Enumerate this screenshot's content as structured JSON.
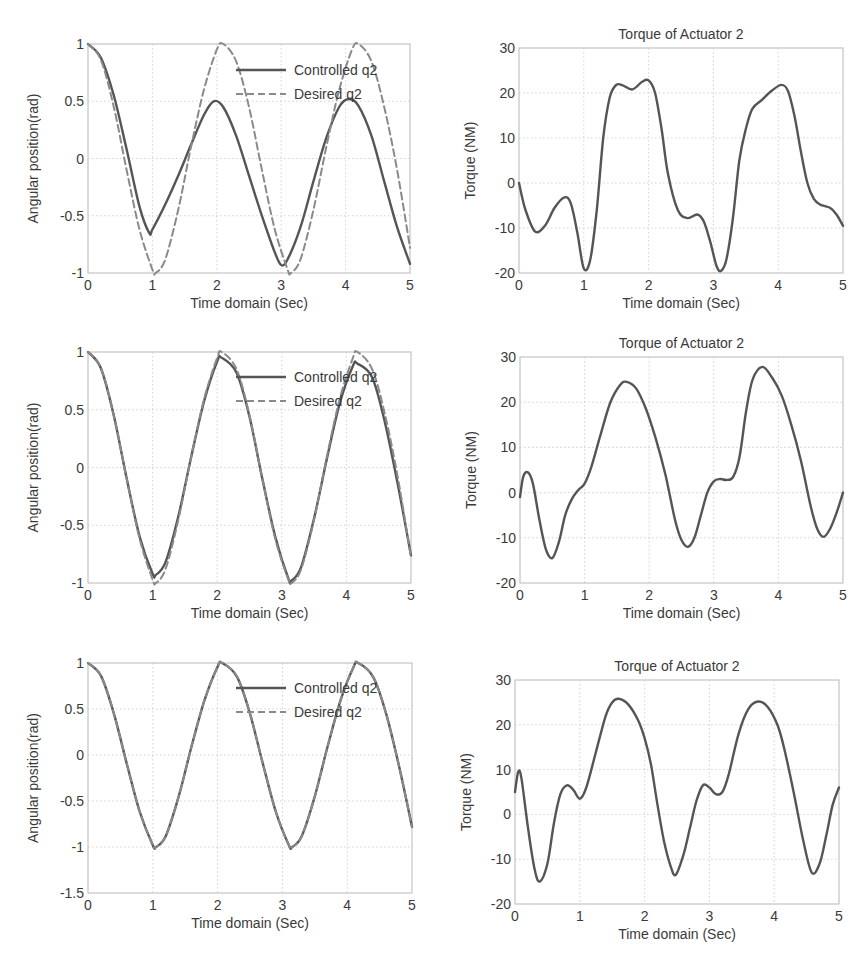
{
  "chart_data": [
    {
      "id": "p1",
      "type": "line",
      "title": "",
      "xlabel": "Time domain (Sec)",
      "ylabel": "Angular position(rad)",
      "xlim": [
        0,
        5
      ],
      "ylim": [
        -1,
        1
      ],
      "xticks": [
        0,
        1,
        2,
        3,
        4,
        5
      ],
      "yticks": [
        -1,
        -0.5,
        0,
        0.5,
        1
      ],
      "grid": true,
      "legend": {
        "position": "upper-right-inside",
        "entries": [
          "Controlled q2",
          "Desired q2"
        ]
      },
      "series": [
        {
          "name": "Controlled q2",
          "style": "solid",
          "x": [
            0,
            0.2,
            0.4,
            0.6,
            0.8,
            0.95,
            1.0,
            1.2,
            1.4,
            1.6,
            1.8,
            1.95,
            2.1,
            2.3,
            2.5,
            2.7,
            2.9,
            3.0,
            3.1,
            3.3,
            3.5,
            3.7,
            3.9,
            4.05,
            4.2,
            4.4,
            4.6,
            4.8,
            5.0
          ],
          "y": [
            1,
            0.88,
            0.55,
            0.08,
            -0.42,
            -0.65,
            -0.62,
            -0.4,
            -0.15,
            0.12,
            0.38,
            0.5,
            0.45,
            0.2,
            -0.15,
            -0.5,
            -0.82,
            -0.93,
            -0.88,
            -0.6,
            -0.2,
            0.18,
            0.45,
            0.52,
            0.46,
            0.2,
            -0.2,
            -0.6,
            -0.92
          ]
        },
        {
          "name": "Desired q2",
          "style": "dashed",
          "x": [
            0,
            0.2,
            0.4,
            0.6,
            0.8,
            1.0,
            1.05,
            1.2,
            1.4,
            1.6,
            1.8,
            2.0,
            2.1,
            2.3,
            2.5,
            2.7,
            2.9,
            3.1,
            3.15,
            3.3,
            3.5,
            3.7,
            3.9,
            4.1,
            4.2,
            4.4,
            4.6,
            4.8,
            5.0
          ],
          "y": [
            1,
            0.86,
            0.45,
            -0.1,
            -0.62,
            -0.97,
            -1.0,
            -0.88,
            -0.45,
            0.1,
            0.6,
            0.95,
            1.0,
            0.85,
            0.45,
            -0.1,
            -0.62,
            -0.97,
            -1.0,
            -0.88,
            -0.45,
            0.1,
            0.6,
            0.95,
            1.0,
            0.85,
            0.45,
            -0.1,
            -0.78
          ]
        }
      ]
    },
    {
      "id": "p2",
      "type": "line",
      "title": "Torque of Actuator 2",
      "xlabel": "Time domain (Sec)",
      "ylabel": "Torque (NM)",
      "xlim": [
        0,
        5
      ],
      "ylim": [
        -20,
        30
      ],
      "xticks": [
        0,
        1,
        2,
        3,
        4,
        5
      ],
      "yticks": [
        -20,
        -10,
        0,
        10,
        20,
        30
      ],
      "grid": true,
      "series": [
        {
          "name": "Torque",
          "x": [
            0,
            0.1,
            0.25,
            0.4,
            0.55,
            0.7,
            0.8,
            0.9,
            1.0,
            1.1,
            1.2,
            1.3,
            1.4,
            1.5,
            1.6,
            1.75,
            1.9,
            2.0,
            2.1,
            2.2,
            2.3,
            2.45,
            2.6,
            2.75,
            2.85,
            2.95,
            3.05,
            3.12,
            3.2,
            3.3,
            3.4,
            3.5,
            3.6,
            3.75,
            3.9,
            4.05,
            4.15,
            4.25,
            4.35,
            4.45,
            4.55,
            4.65,
            4.8,
            4.9,
            5.0
          ],
          "y": [
            0,
            -6,
            -10.8,
            -9.5,
            -5.5,
            -3.2,
            -4.5,
            -11,
            -19,
            -17,
            -6,
            10,
            19,
            21.8,
            21.7,
            20.8,
            22.5,
            22.8,
            20,
            12,
            2,
            -6,
            -7.8,
            -7,
            -8.5,
            -13,
            -18.5,
            -19.5,
            -17,
            -8,
            5,
            12,
            16.5,
            18.5,
            20.5,
            21.8,
            20.5,
            15,
            7,
            0,
            -3.5,
            -4.8,
            -5.5,
            -7,
            -9.5
          ]
        }
      ]
    },
    {
      "id": "p3",
      "type": "line",
      "title": "",
      "xlabel": "Time domain (Sec)",
      "ylabel": "Angular position(rad)",
      "xlim": [
        0,
        5
      ],
      "ylim": [
        -1,
        1
      ],
      "xticks": [
        0,
        1,
        2,
        3,
        4,
        5
      ],
      "yticks": [
        -1,
        -0.5,
        0,
        0.5,
        1
      ],
      "grid": true,
      "legend": {
        "position": "upper-right-inside",
        "entries": [
          "Controlled q2",
          "Desired q2"
        ]
      },
      "series": [
        {
          "name": "Controlled q2",
          "style": "solid",
          "x": [
            0,
            0.2,
            0.4,
            0.6,
            0.8,
            1.0,
            1.05,
            1.2,
            1.4,
            1.6,
            1.8,
            2.0,
            2.07,
            2.3,
            2.5,
            2.7,
            2.9,
            3.1,
            3.15,
            3.3,
            3.5,
            3.7,
            3.9,
            4.1,
            4.17,
            4.4,
            4.6,
            4.8,
            5.0
          ],
          "y": [
            1,
            0.86,
            0.45,
            -0.1,
            -0.6,
            -0.92,
            -0.93,
            -0.82,
            -0.42,
            0.1,
            0.58,
            0.92,
            0.95,
            0.82,
            0.44,
            -0.1,
            -0.6,
            -0.96,
            -0.98,
            -0.86,
            -0.44,
            0.08,
            0.56,
            0.88,
            0.9,
            0.78,
            0.38,
            -0.16,
            -0.76
          ]
        },
        {
          "name": "Desired q2",
          "style": "dashed",
          "x": [
            0,
            0.2,
            0.4,
            0.6,
            0.8,
            1.0,
            1.05,
            1.2,
            1.4,
            1.6,
            1.8,
            2.0,
            2.07,
            2.3,
            2.5,
            2.7,
            2.9,
            3.1,
            3.15,
            3.3,
            3.5,
            3.7,
            3.9,
            4.1,
            4.17,
            4.4,
            4.6,
            4.8,
            5.0
          ],
          "y": [
            1,
            0.86,
            0.45,
            -0.1,
            -0.62,
            -0.97,
            -1.0,
            -0.88,
            -0.45,
            0.1,
            0.6,
            0.95,
            1.0,
            0.85,
            0.45,
            -0.1,
            -0.62,
            -0.97,
            -1.0,
            -0.88,
            -0.45,
            0.1,
            0.6,
            0.95,
            1.0,
            0.85,
            0.45,
            -0.1,
            -0.78
          ]
        }
      ]
    },
    {
      "id": "p4",
      "type": "line",
      "title": "Torque of Actuator 2",
      "xlabel": "Time domain (Sec)",
      "ylabel": "Torque (NM)",
      "xlim": [
        0,
        5
      ],
      "ylim": [
        -20,
        30
      ],
      "xticks": [
        0,
        1,
        2,
        3,
        4,
        5
      ],
      "yticks": [
        -20,
        -10,
        0,
        10,
        20,
        30
      ],
      "grid": true,
      "series": [
        {
          "name": "Torque",
          "x": [
            0,
            0.05,
            0.12,
            0.2,
            0.3,
            0.4,
            0.5,
            0.6,
            0.7,
            0.8,
            0.9,
            1.0,
            1.1,
            1.25,
            1.4,
            1.55,
            1.65,
            1.8,
            1.95,
            2.1,
            2.25,
            2.4,
            2.5,
            2.6,
            2.7,
            2.8,
            2.9,
            3.0,
            3.1,
            3.2,
            3.3,
            3.4,
            3.5,
            3.6,
            3.75,
            3.9,
            4.05,
            4.2,
            4.35,
            4.5,
            4.6,
            4.7,
            4.8,
            4.9,
            5.0
          ],
          "y": [
            -1,
            3.5,
            4.5,
            2,
            -6,
            -12.5,
            -14.5,
            -11,
            -5,
            -1.5,
            0.5,
            2,
            5.5,
            13,
            20,
            23.8,
            24.5,
            23,
            18.5,
            12,
            4,
            -6,
            -10.5,
            -12,
            -10,
            -5,
            0,
            2.5,
            3,
            2.8,
            3.5,
            8,
            18,
            25,
            27.8,
            25.5,
            21.5,
            15,
            7,
            -3,
            -8,
            -9.8,
            -8,
            -4.5,
            0
          ]
        }
      ]
    },
    {
      "id": "p5",
      "type": "line",
      "title": "",
      "xlabel": "Time domain (Sec)",
      "ylabel": "Angular position(rad)",
      "xlim": [
        0,
        5
      ],
      "ylim": [
        -1.5,
        1
      ],
      "xticks": [
        0,
        1,
        2,
        3,
        4,
        5
      ],
      "yticks": [
        -1.5,
        -1,
        -0.5,
        0,
        0.5,
        1
      ],
      "grid": true,
      "legend": {
        "position": "upper-right-inside",
        "entries": [
          "Controlled q2",
          "Desired q2"
        ]
      },
      "series": [
        {
          "name": "Controlled q2",
          "style": "solid",
          "x": [
            0,
            0.2,
            0.4,
            0.6,
            0.8,
            1.0,
            1.05,
            1.2,
            1.4,
            1.6,
            1.8,
            2.0,
            2.07,
            2.3,
            2.5,
            2.7,
            2.9,
            3.1,
            3.15,
            3.3,
            3.5,
            3.7,
            3.9,
            4.1,
            4.17,
            4.4,
            4.6,
            4.8,
            5.0
          ],
          "y": [
            1,
            0.86,
            0.45,
            -0.1,
            -0.62,
            -0.98,
            -1.0,
            -0.88,
            -0.45,
            0.1,
            0.6,
            0.96,
            1.0,
            0.85,
            0.45,
            -0.1,
            -0.62,
            -0.98,
            -1.0,
            -0.88,
            -0.45,
            0.1,
            0.6,
            0.96,
            1.0,
            0.85,
            0.45,
            -0.12,
            -0.78
          ]
        },
        {
          "name": "Desired q2",
          "style": "dashed",
          "x": [
            0,
            0.2,
            0.4,
            0.6,
            0.8,
            1.0,
            1.05,
            1.2,
            1.4,
            1.6,
            1.8,
            2.0,
            2.07,
            2.3,
            2.5,
            2.7,
            2.9,
            3.1,
            3.15,
            3.3,
            3.5,
            3.7,
            3.9,
            4.1,
            4.17,
            4.4,
            4.6,
            4.8,
            5.0
          ],
          "y": [
            1,
            0.86,
            0.45,
            -0.1,
            -0.62,
            -0.98,
            -1.0,
            -0.88,
            -0.45,
            0.1,
            0.6,
            0.96,
            1.0,
            0.85,
            0.45,
            -0.1,
            -0.62,
            -0.98,
            -1.0,
            -0.88,
            -0.45,
            0.1,
            0.6,
            0.96,
            1.0,
            0.85,
            0.45,
            -0.12,
            -0.78
          ]
        }
      ]
    },
    {
      "id": "p6",
      "type": "line",
      "title": "Torque of Actuator 2",
      "xlabel": "Time domain (Sec)",
      "ylabel": "Torque (NM)",
      "xlim": [
        0,
        5
      ],
      "ylim": [
        -20,
        30
      ],
      "xticks": [
        0,
        1,
        2,
        3,
        4,
        5
      ],
      "yticks": [
        -20,
        -10,
        0,
        10,
        20,
        30
      ],
      "grid": true,
      "series": [
        {
          "name": "Torque",
          "x": [
            0,
            0.05,
            0.1,
            0.2,
            0.3,
            0.38,
            0.5,
            0.6,
            0.7,
            0.8,
            0.9,
            1.0,
            1.1,
            1.25,
            1.4,
            1.5,
            1.6,
            1.75,
            1.9,
            2.0,
            2.1,
            2.2,
            2.3,
            2.4,
            2.48,
            2.6,
            2.7,
            2.8,
            2.9,
            3.0,
            3.1,
            3.2,
            3.3,
            3.45,
            3.6,
            3.75,
            3.9,
            4.05,
            4.15,
            4.3,
            4.45,
            4.58,
            4.7,
            4.8,
            4.9,
            5.0
          ],
          "y": [
            5,
            9.5,
            8,
            -3,
            -12,
            -15,
            -11,
            -2,
            4.5,
            6.5,
            5.5,
            3.5,
            6,
            14,
            22,
            25,
            25.8,
            24.5,
            21,
            17,
            11,
            2,
            -6,
            -11.5,
            -13.5,
            -9,
            -3,
            3,
            6.5,
            6,
            4.5,
            5,
            9,
            18,
            23.5,
            25.2,
            24,
            20,
            15,
            5,
            -6,
            -13,
            -11,
            -5,
            2,
            6
          ]
        }
      ]
    }
  ]
}
